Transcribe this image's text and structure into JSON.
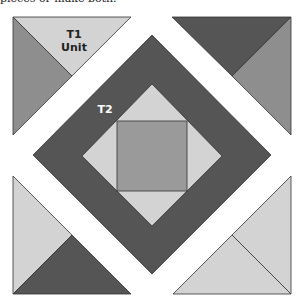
{
  "caption": "pieces or make both.",
  "colors": {
    "light": "#d3d3d3",
    "medium": "#8e8e8e",
    "dark": "#555555",
    "center": "#9a9a9a",
    "background": "#ffffff",
    "stroke": "#333333"
  },
  "labels": {
    "t1_line1": "T1",
    "t1_line2": "Unit",
    "t2": "T2"
  },
  "diagram": {
    "pieces": [
      {
        "name": "corner-top-left",
        "halves": [
          "light",
          "medium"
        ],
        "label": "T1 Unit"
      },
      {
        "name": "corner-top-right",
        "halves": [
          "dark",
          "medium"
        ]
      },
      {
        "name": "corner-bottom-left",
        "halves": [
          "light",
          "dark"
        ]
      },
      {
        "name": "corner-bottom-right",
        "halves": [
          "light",
          "light"
        ]
      },
      {
        "name": "outer-frame",
        "color": "dark",
        "label": "T2"
      },
      {
        "name": "inner-diamond",
        "color": "light"
      },
      {
        "name": "center-square",
        "color": "center"
      }
    ]
  }
}
